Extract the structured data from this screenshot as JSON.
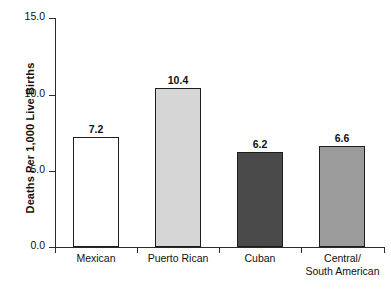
{
  "chart_data": {
    "type": "bar",
    "title": "",
    "subtitle": "",
    "xlabel": "",
    "ylabel": "Deaths Per 1,000 Live Births",
    "categories": [
      "Mexican",
      "Puerto Rican",
      "Cuban",
      "Central/ South American"
    ],
    "category_lines": [
      [
        "Mexican"
      ],
      [
        "Puerto Rican"
      ],
      [
        "Cuban"
      ],
      [
        "Central/",
        "South American"
      ]
    ],
    "values": [
      7.2,
      10.4,
      6.2,
      6.6
    ],
    "value_labels": [
      "7.2",
      "10.4",
      "6.2",
      "6.6"
    ],
    "ylim": [
      0.0,
      15.0
    ],
    "yticks": [
      15.0,
      10.0,
      5.0,
      0.0
    ],
    "ytick_labels": [
      "15.0",
      "10.0",
      "5.0",
      "0.0"
    ],
    "grid": false,
    "legend": null,
    "bar_colors": [
      "#ffffff",
      "#d6d6d6",
      "#4a4a4a",
      "#9b9b9b"
    ],
    "bar_edge_color": "#1d1d1d",
    "axis_color": "#2b2b2b",
    "text_color": "#111111",
    "background": "#ffffff"
  }
}
